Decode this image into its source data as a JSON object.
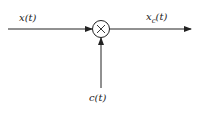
{
  "diagram": {
    "type": "signal-flow",
    "title": "",
    "nodes": [
      {
        "id": "multiplier",
        "symbol": "×",
        "shape": "circle"
      }
    ],
    "input_label": "x(t)",
    "carrier_label": "c(t)",
    "output_label_main": "x",
    "output_label_sub": "c",
    "output_label_tail": "(t)",
    "colors": {
      "line": "#222222",
      "background": "#ffffff"
    }
  }
}
